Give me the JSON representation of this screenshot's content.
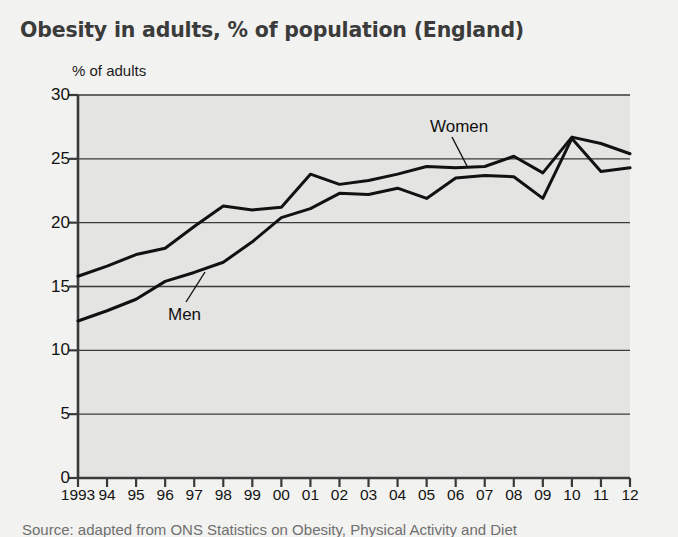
{
  "title": "Obesity in adults, % of population (England)",
  "axis_note": "% of adults",
  "source": "Source: adapted from ONS Statistics on Obesity, Physical Activity and Diet",
  "labels": {
    "men": "Men",
    "women": "Women"
  },
  "colors": {
    "plot_background": "#e4e4e2",
    "page_background": "#f2f2f0",
    "line": "#111111",
    "gridline": "#3a3a3a",
    "title": "#3b3b3b"
  },
  "chart_data": {
    "type": "line",
    "title": "Obesity in adults, % of population (England)",
    "xlabel": "",
    "ylabel": "% of adults",
    "ylim": [
      0,
      30
    ],
    "yticks": [
      0,
      5,
      10,
      15,
      20,
      25,
      30
    ],
    "ytick_labels": [
      "0",
      "5",
      "10",
      "15",
      "20",
      "25",
      "30"
    ],
    "grid": true,
    "legend": "inline-annotations",
    "categories": [
      1993,
      1994,
      1995,
      1996,
      1997,
      1998,
      1999,
      2000,
      2001,
      2002,
      2003,
      2004,
      2005,
      2006,
      2007,
      2008,
      2009,
      2010,
      2011,
      2012
    ],
    "xtick_labels": [
      "1993",
      "94",
      "95",
      "96",
      "97",
      "98",
      "99",
      "00",
      "01",
      "02",
      "03",
      "04",
      "05",
      "06",
      "07",
      "08",
      "09",
      "10",
      "11",
      "12"
    ],
    "series": [
      {
        "name": "Women",
        "values": [
          15.8,
          16.6,
          17.5,
          18.0,
          19.7,
          21.3,
          21.0,
          21.2,
          23.8,
          23.0,
          23.3,
          23.8,
          24.4,
          24.3,
          24.4,
          25.2,
          23.9,
          26.7,
          26.2,
          25.4
        ]
      },
      {
        "name": "Men",
        "values": [
          12.3,
          13.1,
          14.0,
          15.4,
          16.1,
          16.9,
          18.5,
          20.4,
          21.1,
          22.3,
          22.2,
          22.7,
          21.9,
          23.5,
          23.7,
          23.6,
          21.9,
          26.6,
          24.0,
          24.3
        ]
      }
    ],
    "annotations": [
      {
        "text": "Men",
        "series": "Men",
        "x": 1996,
        "leader_line": true
      },
      {
        "text": "Women",
        "series": "Women",
        "x": 2005,
        "leader_line": true
      }
    ]
  }
}
